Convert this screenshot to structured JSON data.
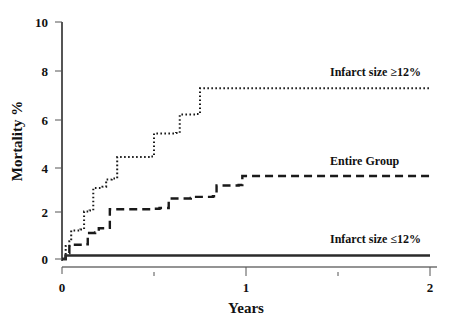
{
  "chart_data": {
    "type": "line",
    "subtype": "kaplan-meier-step",
    "title": "",
    "xlabel": "Years",
    "ylabel": "Mortality %",
    "xlim": [
      0,
      2
    ],
    "ylim": [
      0,
      10
    ],
    "xticks": [
      0,
      1,
      2
    ],
    "xticklabels": [
      "0",
      "1",
      "2"
    ],
    "xminorticks": [
      0.5,
      1.5
    ],
    "yticks": [
      0,
      2,
      4,
      6,
      8,
      10
    ],
    "yticklabels": [
      "0",
      "2",
      "4",
      "6",
      "8",
      "10"
    ],
    "grid": false,
    "legend": "inline-annotations",
    "series": [
      {
        "name": "Infarct size ≥12%",
        "linestyle": "dotted",
        "color": "#1a1a1a",
        "label_x": 1.47,
        "label_y": 7.95,
        "points": [
          [
            0.0,
            0.0
          ],
          [
            0.02,
            0.55
          ],
          [
            0.04,
            0.75
          ],
          [
            0.05,
            1.2
          ],
          [
            0.1,
            1.25
          ],
          [
            0.12,
            2.0
          ],
          [
            0.15,
            2.05
          ],
          [
            0.17,
            3.0
          ],
          [
            0.22,
            3.05
          ],
          [
            0.24,
            3.35
          ],
          [
            0.27,
            3.4
          ],
          [
            0.3,
            4.3
          ],
          [
            0.48,
            4.33
          ],
          [
            0.5,
            5.3
          ],
          [
            0.62,
            5.32
          ],
          [
            0.64,
            6.1
          ],
          [
            0.73,
            6.12
          ],
          [
            0.75,
            7.2
          ],
          [
            2.0,
            7.2
          ]
        ]
      },
      {
        "name": "Entire Group",
        "linestyle": "dashed",
        "color": "#1a1a1a",
        "label_x": 1.43,
        "label_y": 4.15,
        "points": [
          [
            0.0,
            0.0
          ],
          [
            0.02,
            0.25
          ],
          [
            0.04,
            0.6
          ],
          [
            0.12,
            0.62
          ],
          [
            0.14,
            1.1
          ],
          [
            0.18,
            1.12
          ],
          [
            0.2,
            1.3
          ],
          [
            0.24,
            1.32
          ],
          [
            0.26,
            2.1
          ],
          [
            0.5,
            2.12
          ],
          [
            0.53,
            2.15
          ],
          [
            0.58,
            2.55
          ],
          [
            0.7,
            2.58
          ],
          [
            0.72,
            2.62
          ],
          [
            0.82,
            2.65
          ],
          [
            0.84,
            3.1
          ],
          [
            0.96,
            3.12
          ],
          [
            0.98,
            3.5
          ],
          [
            2.0,
            3.5
          ]
        ]
      },
      {
        "name": "Infarct size ≤12%",
        "linestyle": "solid",
        "color": "#2b2b2b",
        "label_x": 1.47,
        "label_y": 1.1,
        "points": [
          [
            0.0,
            0.0
          ],
          [
            0.02,
            0.15
          ],
          [
            2.0,
            0.15
          ]
        ]
      }
    ]
  },
  "labels": {
    "ylabel": "Mortality %",
    "xlabel": "Years",
    "series_high": "Infarct size ≥12%",
    "series_entire": "Entire Group",
    "series_low": "Infarct size ≤12%",
    "ytick_10": "10",
    "ytick_8": "8",
    "ytick_6": "6",
    "ytick_4": "4",
    "ytick_2": "2",
    "ytick_0": "0",
    "xtick_0": "0",
    "xtick_1": "1",
    "xtick_2": "2"
  },
  "colors": {
    "line": "#1a1a1a",
    "axis": "#2b2b2b",
    "background": "#ffffff"
  }
}
